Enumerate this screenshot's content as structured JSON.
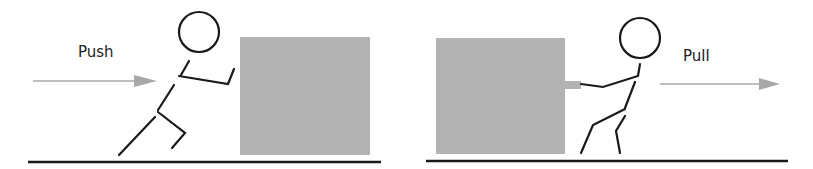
{
  "panels": [
    {
      "id": "push",
      "label": "Push",
      "arrow_direction": "right",
      "description": "stick figure pushing box"
    },
    {
      "id": "pull",
      "label": "Pull",
      "arrow_direction": "right",
      "description": "stick figure pulling box"
    }
  ],
  "colors": {
    "box": "#b3b3b3",
    "arrow": "#a8a8a8",
    "line": "#1a1a1a"
  }
}
